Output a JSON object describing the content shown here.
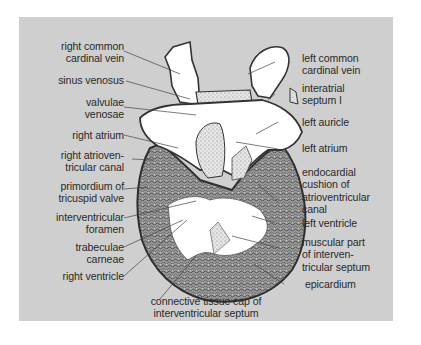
{
  "diagram": {
    "colors": {
      "panel": "#cfcfcf",
      "lumen": "#ffffff",
      "tissue": "#8a8a8a",
      "outline": "#333333",
      "text": "#2a2a2a"
    },
    "labels_left": [
      {
        "id": "right-common-cardinal-vein",
        "lines": [
          "right common",
          "cardinal vein"
        ]
      },
      {
        "id": "sinus-venosus",
        "lines": [
          "sinus venosus"
        ]
      },
      {
        "id": "valvulae-venosae",
        "lines": [
          "valvulae",
          "venosae"
        ]
      },
      {
        "id": "right-atrium",
        "lines": [
          "right atrium"
        ]
      },
      {
        "id": "right-atrioventricular-canal",
        "lines": [
          "right atrioven-",
          "tricular canal"
        ]
      },
      {
        "id": "primordium-of-tricuspid-valve",
        "lines": [
          "primordium of",
          "tricuspid valve"
        ]
      },
      {
        "id": "interventricular-foramen",
        "lines": [
          "interventricular",
          "foramen"
        ]
      },
      {
        "id": "trabeculae-carneae",
        "lines": [
          "trabeculae",
          "carneae"
        ]
      },
      {
        "id": "right-ventricle",
        "lines": [
          "right ventricle"
        ]
      }
    ],
    "labels_right": [
      {
        "id": "left-common-cardinal-vein",
        "lines": [
          "left common",
          "cardinal vein"
        ]
      },
      {
        "id": "interatrial-septum-i",
        "lines": [
          "interatrial",
          "septum I"
        ]
      },
      {
        "id": "left-auricle",
        "lines": [
          "left auricle"
        ]
      },
      {
        "id": "left-atrium",
        "lines": [
          "left atrium"
        ]
      },
      {
        "id": "endocardial-cushion",
        "lines": [
          "endocardial",
          "cushion of",
          "atrioventricular",
          "canal"
        ]
      },
      {
        "id": "left-ventricle",
        "lines": [
          "left ventricle"
        ]
      },
      {
        "id": "muscular-part-of-interventricular-septum",
        "lines": [
          "muscular part",
          "of interven-",
          "tricular septum"
        ]
      },
      {
        "id": "epicardium",
        "lines": [
          "epicardium"
        ]
      }
    ],
    "labels_bottom": [
      {
        "id": "connective-tissue-cap",
        "lines": [
          "connective tissue cap of",
          "interventricular septum"
        ]
      }
    ]
  }
}
